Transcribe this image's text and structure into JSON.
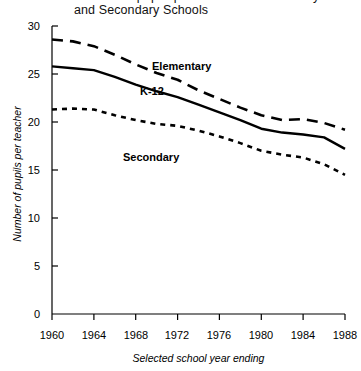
{
  "title": {
    "line1": "Number of pupils per teacher in Elementary",
    "line2": "and Secondary Schools"
  },
  "axes": {
    "ylabel": "Number of pupils per teacher",
    "xlabel": "Selected school year ending",
    "yticks": [
      "0",
      "5",
      "10",
      "15",
      "20",
      "25",
      "30"
    ],
    "xticks": [
      "1960",
      "1964",
      "1968",
      "1972",
      "1976",
      "1980",
      "1984",
      "1988"
    ]
  },
  "series_labels": {
    "elementary": "Elementary",
    "k12": "K-12",
    "secondary": "Secondary"
  },
  "colors": {
    "line": "#000000",
    "axis": "#000000",
    "background": "#ffffff"
  },
  "chart_data": {
    "type": "line",
    "title": "Number of pupils per teacher in Elementary and Secondary Schools",
    "xlabel": "Selected school year ending",
    "ylabel": "Number of pupils per teacher",
    "xlim": [
      1960,
      1988
    ],
    "ylim": [
      0,
      30
    ],
    "ytick_values": [
      0,
      5,
      10,
      15,
      20,
      25,
      30
    ],
    "xtick_values": [
      1960,
      1964,
      1968,
      1972,
      1976,
      1980,
      1984,
      1988
    ],
    "grid": false,
    "legend": "inline-annotations",
    "x": [
      1960,
      1962,
      1964,
      1966,
      1968,
      1970,
      1972,
      1974,
      1976,
      1978,
      1980,
      1982,
      1984,
      1986,
      1988
    ],
    "series": [
      {
        "name": "Elementary",
        "style": "long-dashed",
        "values": [
          28.6,
          28.4,
          27.9,
          27.0,
          26.0,
          25.1,
          24.4,
          23.3,
          22.4,
          21.5,
          20.7,
          20.2,
          20.3,
          19.9,
          19.2
        ]
      },
      {
        "name": "K-12",
        "style": "solid",
        "values": [
          25.8,
          25.6,
          25.4,
          24.7,
          23.9,
          23.2,
          22.6,
          21.8,
          21.0,
          20.2,
          19.3,
          18.9,
          18.7,
          18.4,
          17.2
        ]
      },
      {
        "name": "Secondary",
        "style": "short-dashed",
        "values": [
          21.3,
          21.4,
          21.3,
          20.7,
          20.2,
          19.8,
          19.6,
          19.1,
          18.5,
          17.8,
          17.0,
          16.6,
          16.3,
          15.6,
          14.5
        ]
      }
    ]
  }
}
